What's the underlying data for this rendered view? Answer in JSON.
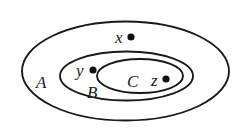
{
  "diagram": {
    "type": "venn-nested-sets",
    "width": 249,
    "height": 136,
    "stroke_color": "#1a1a1a",
    "point_color": "#111111",
    "sets": [
      {
        "id": "A",
        "label": "A",
        "cx": 125.5,
        "cy": 71,
        "rx": 103.5,
        "ry": 49.5,
        "label_x": 36,
        "label_y": 88
      },
      {
        "id": "B",
        "label": "B",
        "cx": 126.5,
        "cy": 76,
        "rx": 66.5,
        "ry": 24.5,
        "label_x": 87,
        "label_y": 98
      },
      {
        "id": "C",
        "label": "C",
        "cx": 140,
        "cy": 76,
        "rx": 43,
        "ry": 17,
        "label_x": 127,
        "label_y": 87
      }
    ],
    "points": [
      {
        "id": "x",
        "label": "x",
        "cx": 131,
        "cy": 37,
        "r": 3.6,
        "label_x": 115,
        "label_y": 43,
        "member_of": [
          "A"
        ]
      },
      {
        "id": "y",
        "label": "y",
        "cx": 93,
        "cy": 70,
        "r": 3.6,
        "label_x": 76,
        "label_y": 76,
        "member_of": [
          "A",
          "B"
        ]
      },
      {
        "id": "z",
        "label": "z",
        "cx": 166,
        "cy": 79,
        "r": 3.6,
        "label_x": 151,
        "label_y": 86,
        "member_of": [
          "A",
          "B",
          "C"
        ]
      }
    ],
    "relations": [
      "C ⊂ B",
      "B ⊂ A",
      "x ∈ A, x ∉ B",
      "y ∈ B, y ∉ C",
      "z ∈ C"
    ]
  }
}
